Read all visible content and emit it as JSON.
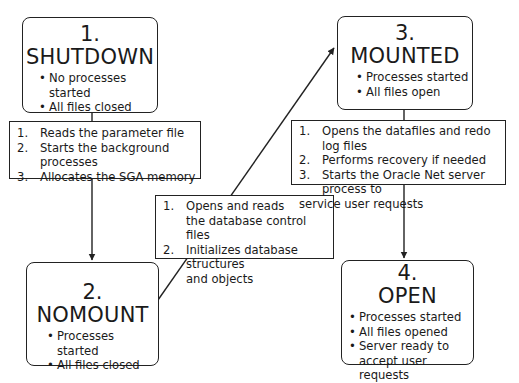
{
  "diagram": {
    "states": [
      {
        "number": "1.",
        "name": "SHUTDOWN",
        "bullets": [
          "No processes started",
          "All files closed"
        ]
      },
      {
        "number": "2.",
        "name": "NOMOUNT",
        "bullets": [
          "Processes started",
          "All files closed"
        ]
      },
      {
        "number": "3.",
        "name": "MOUNTED",
        "bullets": [
          "Processes started",
          "All files open"
        ]
      },
      {
        "number": "4.",
        "name": "OPEN",
        "bullets": [
          "Processes started",
          "All files opened",
          "Server ready to accept user requests"
        ]
      }
    ],
    "transitions": [
      {
        "from": "SHUTDOWN",
        "to": "NOMOUNT",
        "steps": [
          {
            "index": "1.",
            "text": "Reads the parameter file"
          },
          {
            "index": "2.",
            "text": "Starts the background processes"
          },
          {
            "index": "3.",
            "text": "Allocates the SGA memory"
          }
        ]
      },
      {
        "from": "NOMOUNT",
        "to": "MOUNTED",
        "steps": [
          {
            "index": "1.",
            "text_line1": "Opens and reads",
            "text_line2": "the database control files"
          },
          {
            "index": "2.",
            "text_line1": "Initializes database structures",
            "text_line2": "and objects"
          }
        ]
      },
      {
        "from": "MOUNTED",
        "to": "OPEN",
        "steps": [
          {
            "index": "1.",
            "text": "Opens the datafiles and redo log files"
          },
          {
            "index": "2.",
            "text": "Performs recovery if needed"
          },
          {
            "index": "3.",
            "text_line1": "Starts the Oracle Net server process to",
            "text_line2": "service user requests"
          }
        ]
      }
    ],
    "colors": {
      "line": "#222222",
      "background": "#ffffff",
      "text": "#1a1a1a"
    }
  }
}
